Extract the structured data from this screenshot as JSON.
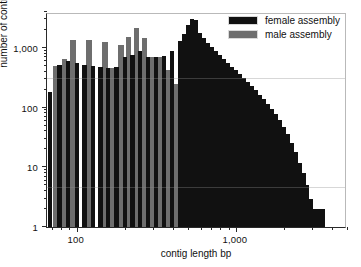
{
  "chart_data": {
    "type": "bar",
    "title": "",
    "xlabel": "contig length bp",
    "ylabel": "number of contigs",
    "xscale": "log",
    "yscale": "log",
    "xlim": [
      65,
      5000
    ],
    "ylim": [
      1,
      4000
    ],
    "grid": false,
    "legend_position": "top-right",
    "xticks_major": [
      100,
      1000
    ],
    "xtick_labels": [
      "100",
      "1,000"
    ],
    "yticks_major": [
      1,
      10,
      100,
      1000
    ],
    "ytick_labels": [
      "1",
      "10",
      "100",
      "1,000"
    ],
    "series": [
      {
        "name": "female assembly",
        "color": "#111111",
        "points": [
          {
            "x": 68,
            "y": 185
          },
          {
            "x": 78,
            "y": 520
          },
          {
            "x": 88,
            "y": 600
          },
          {
            "x": 100,
            "y": 560
          },
          {
            "x": 112,
            "y": 520
          },
          {
            "x": 126,
            "y": 500
          },
          {
            "x": 141,
            "y": 480
          },
          {
            "x": 158,
            "y": 470
          },
          {
            "x": 178,
            "y": 480
          },
          {
            "x": 200,
            "y": 700
          },
          {
            "x": 224,
            "y": 760
          },
          {
            "x": 251,
            "y": 880
          },
          {
            "x": 282,
            "y": 700
          },
          {
            "x": 316,
            "y": 700
          },
          {
            "x": 355,
            "y": 730
          },
          {
            "x": 398,
            "y": 900
          },
          {
            "x": 447,
            "y": 1300
          },
          {
            "x": 473,
            "y": 1700
          },
          {
            "x": 501,
            "y": 2400
          },
          {
            "x": 530,
            "y": 3100
          },
          {
            "x": 562,
            "y": 2900
          },
          {
            "x": 596,
            "y": 1800
          },
          {
            "x": 631,
            "y": 1450
          },
          {
            "x": 668,
            "y": 1200
          },
          {
            "x": 708,
            "y": 1050
          },
          {
            "x": 750,
            "y": 900
          },
          {
            "x": 794,
            "y": 760
          },
          {
            "x": 841,
            "y": 650
          },
          {
            "x": 891,
            "y": 560
          },
          {
            "x": 944,
            "y": 480
          },
          {
            "x": 1000,
            "y": 420
          },
          {
            "x": 1059,
            "y": 360
          },
          {
            "x": 1122,
            "y": 310
          },
          {
            "x": 1189,
            "y": 265
          },
          {
            "x": 1259,
            "y": 230
          },
          {
            "x": 1334,
            "y": 195
          },
          {
            "x": 1413,
            "y": 165
          },
          {
            "x": 1496,
            "y": 140
          },
          {
            "x": 1585,
            "y": 115
          },
          {
            "x": 1679,
            "y": 95
          },
          {
            "x": 1778,
            "y": 78
          },
          {
            "x": 1884,
            "y": 62
          },
          {
            "x": 1995,
            "y": 48
          },
          {
            "x": 2113,
            "y": 36
          },
          {
            "x": 2239,
            "y": 26
          },
          {
            "x": 2371,
            "y": 18
          },
          {
            "x": 2512,
            "y": 12
          },
          {
            "x": 2661,
            "y": 8
          },
          {
            "x": 2818,
            "y": 5
          },
          {
            "x": 2985,
            "y": 3
          },
          {
            "x": 3162,
            "y": 2
          },
          {
            "x": 3350,
            "y": 2
          },
          {
            "x": 3548,
            "y": 2
          }
        ]
      },
      {
        "name": "male assembly",
        "color": "#6e6e6e",
        "points": [
          {
            "x": 74,
            "y": 490
          },
          {
            "x": 84,
            "y": 650
          },
          {
            "x": 95,
            "y": 1350
          },
          {
            "x": 119,
            "y": 1380
          },
          {
            "x": 150,
            "y": 1280
          },
          {
            "x": 168,
            "y": 470
          },
          {
            "x": 190,
            "y": 1100
          },
          {
            "x": 212,
            "y": 1500
          },
          {
            "x": 237,
            "y": 2200
          },
          {
            "x": 266,
            "y": 1450
          },
          {
            "x": 299,
            "y": 700
          },
          {
            "x": 335,
            "y": 700
          },
          {
            "x": 376,
            "y": 420
          },
          {
            "x": 422,
            "y": 250
          },
          {
            "x": 460,
            "y": 210
          },
          {
            "x": 487,
            "y": 170
          },
          {
            "x": 516,
            "y": 130
          },
          {
            "x": 546,
            "y": 100
          },
          {
            "x": 578,
            "y": 75
          },
          {
            "x": 613,
            "y": 48
          },
          {
            "x": 649,
            "y": 30
          },
          {
            "x": 688,
            "y": 12
          },
          {
            "x": 729,
            "y": 5
          },
          {
            "x": 772,
            "y": 5
          },
          {
            "x": 818,
            "y": 5
          },
          {
            "x": 866,
            "y": 3
          },
          {
            "x": 917,
            "y": 3
          }
        ]
      }
    ]
  },
  "legend": {
    "items": [
      {
        "label": "female assembly",
        "color": "#111111"
      },
      {
        "label": "male assembly",
        "color": "#6e6e6e"
      }
    ]
  },
  "axes": {
    "y_title": "number of contigs",
    "x_title": "contig length bp",
    "y_labels": [
      "1,000",
      "100",
      "10",
      "1"
    ],
    "x_labels": [
      "100",
      "1,000"
    ]
  }
}
